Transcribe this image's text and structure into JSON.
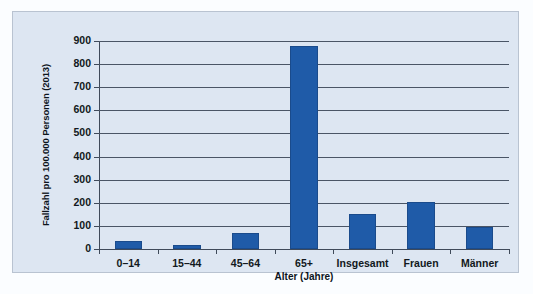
{
  "chart_data": {
    "type": "bar",
    "title": "",
    "subtitle": "",
    "xlabel": "Alter (Jahre)",
    "ylabel": "Fallzahl pro 100.000 Personen (2013)",
    "categories": [
      "0–14",
      "15–44",
      "45–64",
      "65+",
      "Insgesamt",
      "Frauen",
      "Männer"
    ],
    "values": [
      35,
      18,
      70,
      880,
      150,
      205,
      95
    ],
    "ylim": [
      0,
      900
    ],
    "yticks": [
      0,
      100,
      200,
      300,
      400,
      500,
      600,
      700,
      800,
      900
    ],
    "ytick_labels": [
      "0",
      "100",
      "200",
      "300",
      "400",
      "500",
      "600",
      "700",
      "800",
      "900"
    ],
    "grid": true,
    "legend": false,
    "series": [
      {
        "name": "Fallzahl pro 100.000 Personen (2013)",
        "values": [
          35,
          18,
          70,
          880,
          150,
          205,
          95
        ]
      }
    ],
    "colors": {
      "bar": "#1f5ba8",
      "bar_edge": "#1a4b8c",
      "panel_background": "#dde6f2",
      "panel_border": "#b9c3d1",
      "axis": "#3f4a5a",
      "gridline": "#4a5566",
      "text": "#111820",
      "figure_background": "#fbfdff"
    }
  }
}
